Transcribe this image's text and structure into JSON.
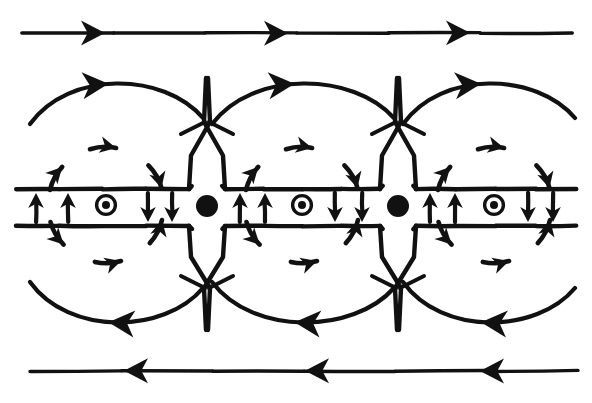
{
  "figure": {
    "style": "hand-drawn line diagram",
    "background_color": "#ffffff",
    "ink_color": "#111111",
    "width": 592,
    "height": 403
  },
  "chart_data": {
    "type": "diagram",
    "xlabel": "",
    "ylabel": "",
    "grid": false,
    "legend": "none",
    "xlim": [
      0,
      592
    ],
    "ylim": [
      0,
      403
    ],
    "elements": {
      "ambient_field_lines": [
        {
          "name": "top-ambient-field-line",
          "direction": "rightward",
          "y": 33,
          "x_start": 22,
          "x_end": 572,
          "arrow_positions": [
            105,
            288,
            470
          ],
          "arrow_direction": "right"
        },
        {
          "name": "bottom-ambient-field-line",
          "direction": "leftward",
          "y": 371,
          "x_start": 30,
          "x_end": 578,
          "arrow_positions": [
            124,
            305,
            480
          ],
          "arrow_direction": "left"
        }
      ],
      "current_sheet": {
        "name": "current-sheet-band",
        "top_edge_y": 189,
        "bottom_edge_y": 226,
        "x_start": 16,
        "x_end": 576,
        "segment_breaks_at_x": [
          207,
          398
        ]
      },
      "x_points": [
        {
          "name": "x-point-1",
          "x": 207,
          "y": 206,
          "radius": 11,
          "marker": "filled-dot"
        },
        {
          "name": "x-point-2",
          "x": 398,
          "y": 206,
          "radius": 11,
          "marker": "filled-dot"
        }
      ],
      "o_points": [
        {
          "name": "o-point-1",
          "x": 106,
          "y": 205,
          "outer_radius": 11,
          "inner_radius": 4,
          "marker": "circled-dot"
        },
        {
          "name": "o-point-2",
          "x": 302,
          "y": 205,
          "outer_radius": 11,
          "inner_radius": 4,
          "marker": "circled-dot"
        },
        {
          "name": "o-point-3",
          "x": 494,
          "y": 205,
          "outer_radius": 11,
          "inner_radius": 4,
          "marker": "circled-dot"
        }
      ],
      "sheet_arrows": [
        {
          "name": "sheet-arrow-up-1",
          "x": 36,
          "direction": "up"
        },
        {
          "name": "sheet-arrow-up-2",
          "x": 68,
          "direction": "up"
        },
        {
          "name": "sheet-arrow-down-1",
          "x": 148,
          "direction": "down"
        },
        {
          "name": "sheet-arrow-down-2",
          "x": 172,
          "direction": "down"
        },
        {
          "name": "sheet-arrow-up-3",
          "x": 240,
          "direction": "up"
        },
        {
          "name": "sheet-arrow-up-4",
          "x": 265,
          "direction": "up"
        },
        {
          "name": "sheet-arrow-down-3",
          "x": 335,
          "direction": "down"
        },
        {
          "name": "sheet-arrow-down-4",
          "x": 362,
          "direction": "down"
        },
        {
          "name": "sheet-arrow-up-5",
          "x": 430,
          "direction": "up"
        },
        {
          "name": "sheet-arrow-up-6",
          "x": 455,
          "direction": "up"
        },
        {
          "name": "sheet-arrow-down-5",
          "x": 528,
          "direction": "down"
        },
        {
          "name": "sheet-arrow-down-6",
          "x": 553,
          "direction": "down"
        }
      ],
      "separatrix_cusps": [
        {
          "name": "separatrix-cusp-top-1",
          "apex_x": 207,
          "apex_y": 78,
          "cross_y": 122,
          "base_y": 189,
          "half_width": 18
        },
        {
          "name": "separatrix-cusp-top-2",
          "apex_x": 398,
          "apex_y": 78,
          "cross_y": 122,
          "base_y": 189,
          "half_width": 18
        },
        {
          "name": "separatrix-cusp-bottom-1",
          "apex_x": 207,
          "apex_y": 330,
          "cross_y": 288,
          "base_y": 226,
          "half_width": 18
        },
        {
          "name": "separatrix-cusp-bottom-2",
          "apex_x": 398,
          "apex_y": 330,
          "cross_y": 288,
          "base_y": 226,
          "half_width": 18
        }
      ],
      "island_arcs_top": [
        {
          "name": "island-arc-top-left",
          "x_start": 30,
          "x_end": 203,
          "apex_y": 76,
          "arrow_at_x": 106,
          "arrow_direction": "right"
        },
        {
          "name": "island-arc-top-middle",
          "x_start": 212,
          "x_end": 394,
          "apex_y": 76,
          "arrow_at_x": 302,
          "arrow_direction": "right"
        },
        {
          "name": "island-arc-top-right",
          "x_start": 403,
          "x_end": 575,
          "apex_y": 76,
          "arrow_at_x": 494,
          "arrow_direction": "right"
        }
      ],
      "island_arcs_bottom": [
        {
          "name": "island-arc-bottom-left",
          "x_start": 30,
          "x_end": 203,
          "apex_y": 330,
          "arrow_at_x": 118,
          "arrow_direction": "left"
        },
        {
          "name": "island-arc-bottom-middle",
          "x_start": 212,
          "x_end": 394,
          "apex_y": 330,
          "arrow_at_x": 305,
          "arrow_direction": "left"
        },
        {
          "name": "island-arc-bottom-right",
          "x_start": 403,
          "x_end": 575,
          "apex_y": 330,
          "arrow_at_x": 495,
          "arrow_direction": "left"
        }
      ],
      "vortex_arrow_groups": [
        {
          "name": "vortex-top-left",
          "center_x": 106,
          "center_y": 205,
          "radius": 58,
          "sense": "clockwise",
          "count": 3
        },
        {
          "name": "vortex-top-middle",
          "center_x": 302,
          "center_y": 205,
          "radius": 58,
          "sense": "clockwise",
          "count": 3
        },
        {
          "name": "vortex-top-right",
          "center_x": 494,
          "center_y": 205,
          "radius": 58,
          "sense": "clockwise",
          "count": 3
        },
        {
          "name": "vortex-bottom-left",
          "center_x": 106,
          "center_y": 205,
          "radius": 58,
          "sense": "counterclockwise",
          "count": 3
        },
        {
          "name": "vortex-bottom-middle",
          "center_x": 302,
          "center_y": 205,
          "radius": 58,
          "sense": "counterclockwise",
          "count": 3
        },
        {
          "name": "vortex-bottom-right",
          "center_x": 494,
          "center_y": 205,
          "radius": 58,
          "sense": "counterclockwise",
          "count": 3
        }
      ]
    },
    "counts": {
      "o_points": 3,
      "x_points": 2,
      "ambient_field_lines": 2,
      "sheet_arrows": 12,
      "separatrix_cusps": 4,
      "island_arcs": 6,
      "vortex_arrow_groups": 6
    }
  }
}
